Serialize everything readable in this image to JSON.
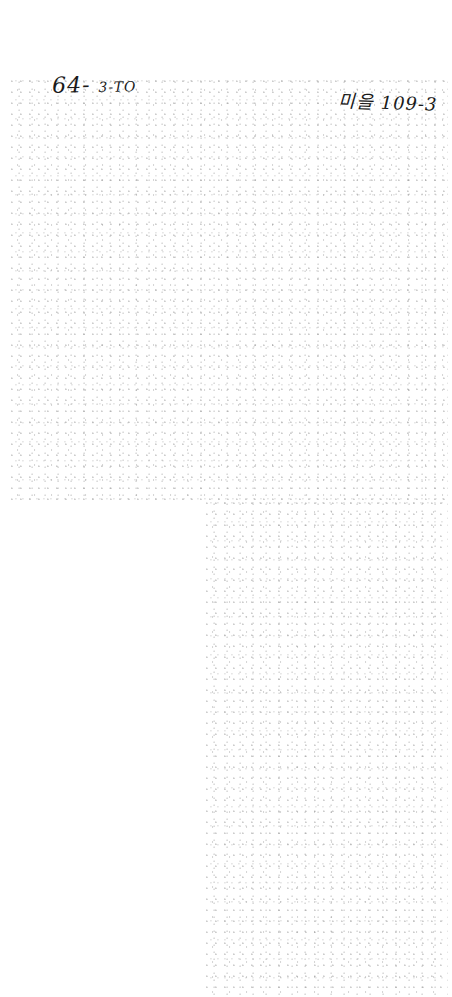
{
  "document": {
    "type": "scanned page",
    "annotations": {
      "top_left": {
        "main": "64-",
        "suffix": "3-TO"
      },
      "top_right": "미을 109-3"
    }
  }
}
